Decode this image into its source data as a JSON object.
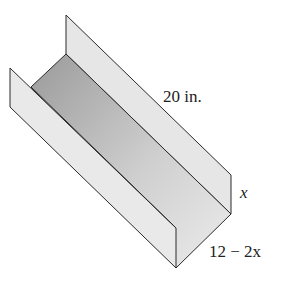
{
  "diagram": {
    "labels": {
      "length": "20 in.",
      "height": "x",
      "width": "12 − 2x"
    },
    "colors": {
      "wall_fill": "#e8e8e8",
      "floor_dark": "#9a9a9a",
      "floor_light": "#e4e4e4",
      "edge": "#2a2a2a"
    }
  }
}
